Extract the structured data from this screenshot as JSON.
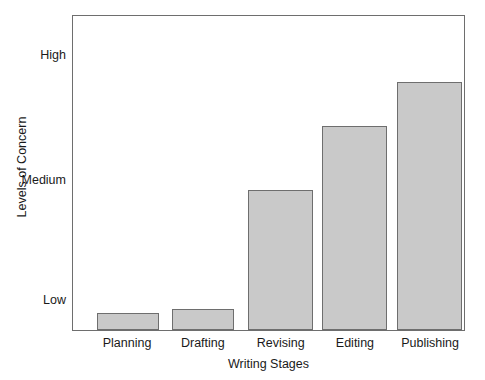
{
  "chart_data": {
    "type": "bar",
    "title": "",
    "xlabel": "Writing Stages",
    "ylabel": "Levels of Concern",
    "categories": [
      "Planning",
      "Drafting",
      "Revising",
      "Editing",
      "Publishing"
    ],
    "values": [
      0.89,
      0.92,
      1.87,
      2.39,
      2.75
    ],
    "value_labels": [
      "",
      "",
      "",
      "",
      ""
    ],
    "ytick_labels": [
      "Low",
      "Medium",
      "High"
    ],
    "ytick_values": [
      1,
      2,
      3
    ],
    "ylim": [
      0.75,
      3.5
    ],
    "xlim": [
      0,
      5
    ],
    "grid": false,
    "legend": false,
    "legend_position": "none",
    "bar_fill_color": "#c9c9c9",
    "bar_edge_color": "#6e6e6e",
    "frame_color": "#6e6e6e",
    "background_color": "#ffffff",
    "text_color": "#1a1a1a",
    "bars": [
      {
        "category": "Planning",
        "value": 0.89,
        "left_pct": 6.1,
        "width_pct": 15.8,
        "height_pct": 5.4
      },
      {
        "category": "Drafting",
        "value": 0.92,
        "left_pct": 25.4,
        "width_pct": 15.8,
        "height_pct": 6.6
      },
      {
        "category": "Revising",
        "value": 1.87,
        "left_pct": 44.8,
        "width_pct": 16.5,
        "height_pct": 44.6
      },
      {
        "category": "Editing",
        "value": 2.39,
        "left_pct": 63.6,
        "width_pct": 16.8,
        "height_pct": 64.9
      },
      {
        "category": "Publishing",
        "value": 2.75,
        "left_pct": 82.9,
        "width_pct": 16.5,
        "height_pct": 79.1
      }
    ],
    "ytick_positions_pct": [
      90.2,
      52.2,
      12.7
    ],
    "xtick_centers_pct": [
      14.0,
      33.3,
      53.1,
      72.0,
      91.1
    ]
  }
}
